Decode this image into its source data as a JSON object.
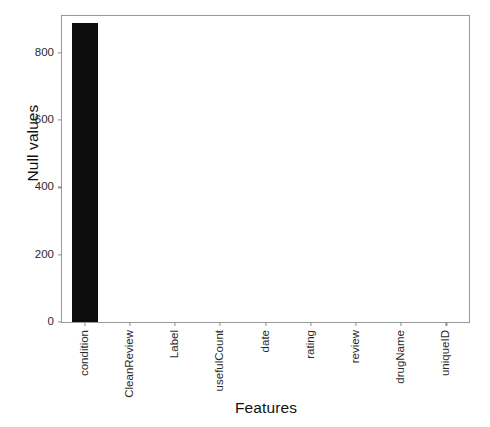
{
  "chart_data": {
    "type": "bar",
    "title": "",
    "xlabel": "Features",
    "ylabel": "Null values",
    "categories": [
      "condition",
      "CleanReview",
      "Label",
      "usefulCount",
      "date",
      "rating",
      "review",
      "drugName",
      "uniqueID"
    ],
    "values": [
      890,
      0,
      0,
      0,
      0,
      0,
      0,
      0,
      0
    ],
    "ylim": [
      0,
      910
    ],
    "yticks": [
      0,
      200,
      400,
      600,
      800
    ],
    "ytick_labels": [
      "0",
      "200",
      "400",
      "600",
      "800"
    ],
    "grid": false,
    "legend": null,
    "bar_color": "#0c0c0c",
    "axis_color": "#9a9a9a",
    "background": "#ffffff"
  }
}
